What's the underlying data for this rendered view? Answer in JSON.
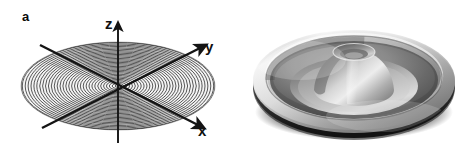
{
  "figure": {
    "background_color": "#ffffff",
    "width": 472,
    "height": 151,
    "panel_count": 2
  },
  "panels": [
    {
      "id": "a",
      "label": "a",
      "caption_letter": "a",
      "type": "schematic-axes-with-concentric-rings",
      "description": "Cartesian axis triad drawn in perspective over a flat elliptical disk filled with densely spaced concentric elliptical contour rings radiating from the origin",
      "axes": [
        {
          "name": "z",
          "label": "z",
          "direction": "up",
          "arrow": true
        },
        {
          "name": "y",
          "label": "y",
          "direction": "upper-right",
          "arrow": true
        },
        {
          "name": "x",
          "label": "x",
          "direction": "lower-right",
          "arrow": true
        }
      ],
      "origin": {
        "x": 118,
        "y": 87
      },
      "disk": {
        "center_x": 118,
        "center_y": 86,
        "radius_x": 97,
        "radius_y": 44,
        "ring_count": 34,
        "ring_color": "#3c3c3c",
        "fill_color": "#f2f2f2"
      },
      "line_color": "#1a1a1a"
    },
    {
      "id": "b",
      "label": "b",
      "caption_letter": "b",
      "type": "rendered-3d-surface",
      "description": "Grayscale shaded three-dimensional rendering of a rotationally symmetric surface: a raised outer rim, an annular trough, and a central volcano-like cone with a small crater dimple at its apex",
      "features": [
        "outer raised rim",
        "annular trough",
        "central cone",
        "apex crater dimple",
        "dark shadowed base"
      ],
      "disk": {
        "center_x": 354,
        "center_y": 84,
        "radius_x": 101,
        "radius_y": 52
      },
      "shading": {
        "light_direction": "upper-left",
        "highlight_color": "#f4f4f4",
        "midtone_color": "#9a9a9a",
        "shadow_color": "#3a3a3a",
        "base_shadow_color": "#141414"
      }
    }
  ],
  "labels": {
    "panel_a": "a",
    "panel_b": "b",
    "axis_z": "z",
    "axis_y": "y",
    "axis_x": "x"
  },
  "colors": {
    "background": "#ffffff",
    "ink": "#101010",
    "ring": "#3c3c3c",
    "surface_light": "#f0f0f0",
    "surface_dark": "#2a2a2a"
  }
}
